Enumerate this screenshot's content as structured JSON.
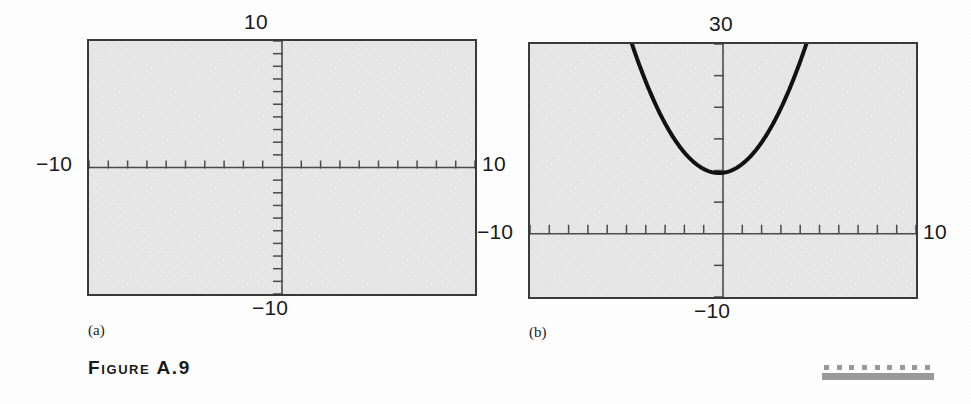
{
  "figure": {
    "caption": "Figure A.9",
    "panels": [
      {
        "id": "a",
        "sub_caption": "(a)",
        "labels": {
          "top": "10",
          "left": "−10",
          "right": "10",
          "bottom": "−10"
        },
        "window": {
          "xmin": -10,
          "xmax": 10,
          "ymin": -10,
          "ymax": 10,
          "xscl": 1,
          "yscl": 1
        },
        "curve": null
      },
      {
        "id": "b",
        "sub_caption": "(b)",
        "labels": {
          "top": "30",
          "left": "−10",
          "right": "10",
          "bottom": "−10"
        },
        "window": {
          "xmin": -10,
          "xmax": 10,
          "ymin": -10,
          "ymax": 30,
          "xscl": 1,
          "yscl": 5
        },
        "curve": {
          "kind": "parabola",
          "label": "y = x² + 10",
          "vertex_x": -0.2,
          "vertex_y": 9.6,
          "a": 1.0,
          "stroke": "#101010",
          "stroke_width": 4
        }
      }
    ]
  },
  "decoration": {
    "name": "dotted-rule",
    "dot_count": 9,
    "dot_color": "#9a9a9a",
    "bar_color": "#9a9a9a"
  },
  "chart_data": [
    {
      "type": "line",
      "title": "(a) empty viewing window",
      "xlabel": "",
      "ylabel": "",
      "xlim": [
        -10,
        10
      ],
      "ylim": [
        -10,
        10
      ],
      "xticks": [
        -10,
        -9,
        -8,
        -7,
        -6,
        -5,
        -4,
        -3,
        -2,
        -1,
        0,
        1,
        2,
        3,
        4,
        5,
        6,
        7,
        8,
        9,
        10
      ],
      "yticks": [
        -10,
        -9,
        -8,
        -7,
        -6,
        -5,
        -4,
        -3,
        -2,
        -1,
        0,
        1,
        2,
        3,
        4,
        5,
        6,
        7,
        8,
        9,
        10
      ],
      "tick_labels": {
        "top": "10",
        "left": "−10",
        "right": "10",
        "bottom": "−10"
      },
      "grid": false,
      "legend": "none",
      "series": []
    },
    {
      "type": "line",
      "title": "(b) parabola in viewing window",
      "xlabel": "",
      "ylabel": "",
      "xlim": [
        -10,
        10
      ],
      "ylim": [
        -10,
        30
      ],
      "xticks": [
        -10,
        -9,
        -8,
        -7,
        -6,
        -5,
        -4,
        -3,
        -2,
        -1,
        0,
        1,
        2,
        3,
        4,
        5,
        6,
        7,
        8,
        9,
        10
      ],
      "yticks": [
        -10,
        -5,
        0,
        5,
        10,
        15,
        20,
        25,
        30
      ],
      "tick_labels": {
        "top": "30",
        "left": "−10",
        "right": "10",
        "bottom": "−10"
      },
      "grid": false,
      "legend": "none",
      "series": [
        {
          "name": "y = x² + 10",
          "x": [
            -4.5,
            -4.0,
            -3.5,
            -3.0,
            -2.5,
            -2.0,
            -1.5,
            -1.0,
            -0.5,
            0.0,
            0.5,
            1.0,
            1.5,
            2.0,
            2.5,
            3.0,
            3.5,
            4.0,
            4.5
          ],
          "values": [
            29.8,
            25.6,
            22.0,
            18.9,
            16.4,
            14.4,
            13.0,
            12.0,
            10.1,
            9.6,
            10.1,
            11.0,
            12.7,
            14.9,
            17.6,
            20.8,
            24.6,
            28.9,
            33.8
          ]
        }
      ]
    }
  ]
}
